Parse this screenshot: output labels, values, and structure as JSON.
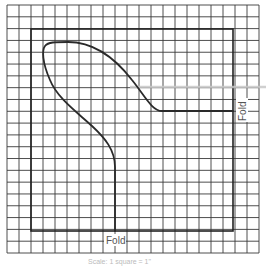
{
  "diagram": {
    "type": "sewing-pattern-grid",
    "grid": {
      "x0": 7,
      "y0": 5,
      "x1": 259,
      "y1": 253,
      "columns": 21,
      "rows": 21,
      "line_color": "#3a3a3a"
    },
    "outline_rect": {
      "x": 31,
      "y": 29,
      "width": 202,
      "height": 202,
      "color": "#222222"
    },
    "pattern_shape_color": "#2a2a2a",
    "highlight_line": {
      "x1": 130,
      "y1": 87,
      "x2": 266,
      "y2": 87,
      "color": "#c8c8c8"
    },
    "labels": {
      "fold_bottom": "Fold",
      "fold_right": "Fold"
    },
    "caption": "Scale: 1 square = 1\""
  }
}
